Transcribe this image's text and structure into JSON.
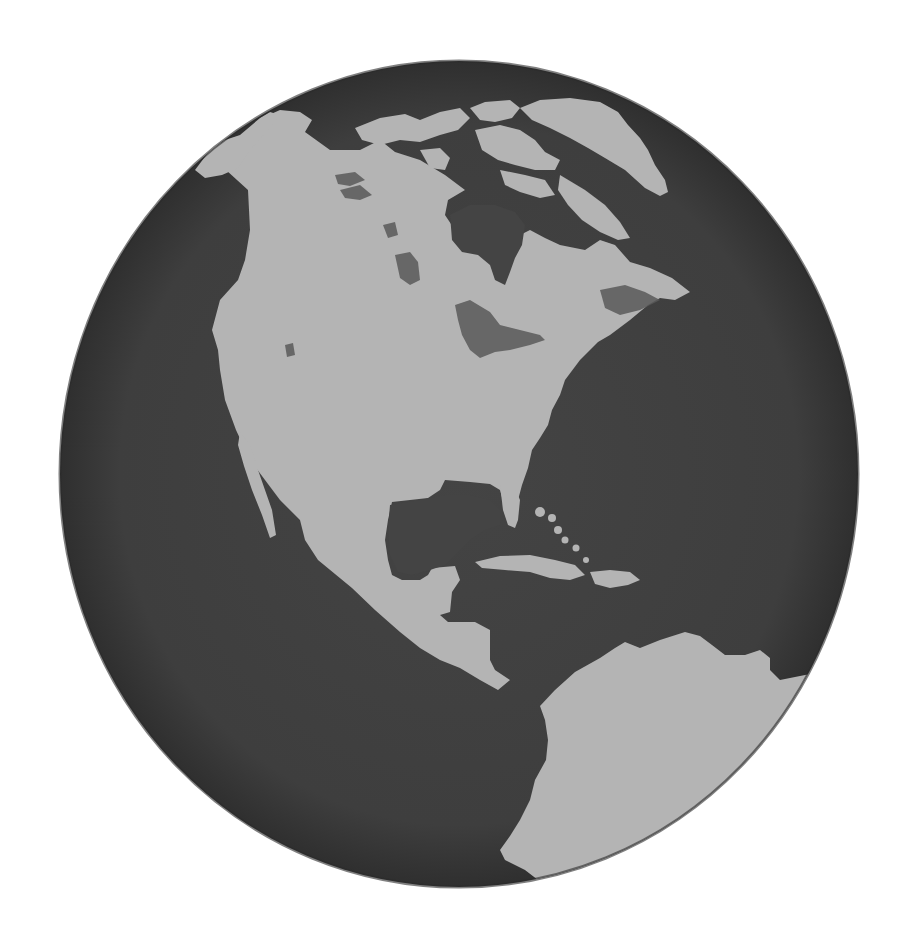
{
  "image": {
    "subject": "Globe showing the Americas",
    "description": "Grayscale rendering of Earth centered on North America, with Central America, the Caribbean and northern South America visible",
    "colors": {
      "background": "#ffffff",
      "ocean": "#3f3f3f",
      "ocean_edge": "#2e2e2e",
      "land": "#b4b4b4",
      "land_shadow": "#8f8f8f",
      "lakes": "#555555"
    },
    "regions": [
      {
        "name": "North America"
      },
      {
        "name": "Greenland"
      },
      {
        "name": "Canadian Arctic Archipelago"
      },
      {
        "name": "Hudson Bay"
      },
      {
        "name": "Great Lakes"
      },
      {
        "name": "Gulf of Mexico"
      },
      {
        "name": "Central America"
      },
      {
        "name": "Caribbean Islands"
      },
      {
        "name": "South America"
      },
      {
        "name": "Baja California"
      },
      {
        "name": "Florida"
      }
    ]
  }
}
